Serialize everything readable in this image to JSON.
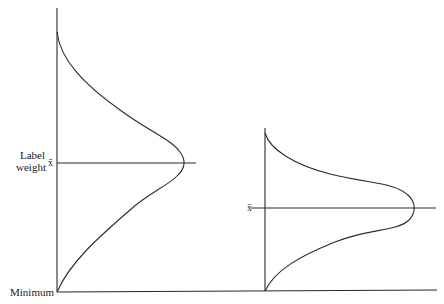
{
  "diagram": {
    "type": "distribution-comparison",
    "labels": {
      "y_axis_line1": "Label",
      "y_axis_line2": "weight",
      "mean_left": "x̄",
      "mean_right": "x̄",
      "minimum": "Minimum"
    },
    "colors": {
      "line": "#2a2a2a",
      "text": "#1a1a1a",
      "background": "#ffffff"
    },
    "distributions": [
      {
        "name": "wide distribution",
        "position": "left",
        "spread": "wide"
      },
      {
        "name": "narrow distribution",
        "position": "right",
        "spread": "narrow"
      }
    ]
  }
}
